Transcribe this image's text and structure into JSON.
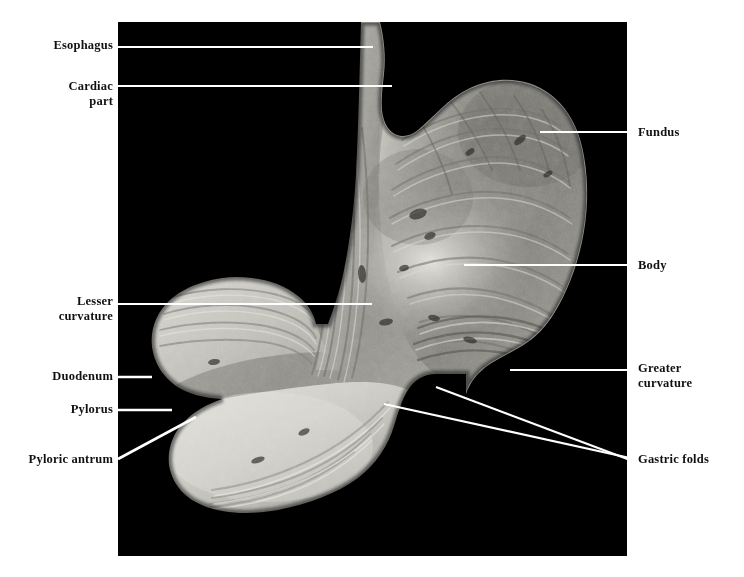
{
  "figure": {
    "type": "labeled-anatomical-photograph",
    "plate": {
      "background_color": "#000000",
      "left": 118,
      "top": 22,
      "width": 509,
      "height": 534
    },
    "page_background": "#ffffff",
    "leader_line_color": "#ffffff",
    "label_text_color": "#111111"
  },
  "labels": [
    {
      "id": "esophagus",
      "text": "Esophagus",
      "side": "left",
      "x": 113,
      "y": 38,
      "align": "right",
      "leader": {
        "kind": "horizontal",
        "x1": 118,
        "y1": 47,
        "x2": 373,
        "y2": 47
      }
    },
    {
      "id": "cardiac-part",
      "text": "Cardiac\npart",
      "side": "left",
      "x": 113,
      "y": 79,
      "align": "right",
      "leader": {
        "kind": "horizontal",
        "x1": 118,
        "y1": 86,
        "x2": 392,
        "y2": 86
      }
    },
    {
      "id": "lesser-curvature",
      "text": "Lesser\ncurvature",
      "side": "left",
      "x": 113,
      "y": 294,
      "align": "right",
      "leader": {
        "kind": "horizontal",
        "x1": 118,
        "y1": 304,
        "x2": 372,
        "y2": 304
      }
    },
    {
      "id": "duodenum",
      "text": "Duodenum",
      "side": "left",
      "x": 113,
      "y": 369,
      "align": "right",
      "leader": {
        "kind": "horizontal",
        "x1": 118,
        "y1": 377,
        "x2": 152,
        "y2": 377
      }
    },
    {
      "id": "pylorus",
      "text": "Pylorus",
      "side": "left",
      "x": 113,
      "y": 402,
      "align": "right",
      "leader": {
        "kind": "horizontal",
        "x1": 118,
        "y1": 410,
        "x2": 172,
        "y2": 410
      }
    },
    {
      "id": "pyloric-antrum",
      "text": "Pyloric antrum",
      "side": "left",
      "x": 113,
      "y": 452,
      "align": "right",
      "leader": {
        "kind": "diagonal",
        "x1": 118,
        "y1": 459,
        "x2": 196,
        "y2": 417
      }
    },
    {
      "id": "fundus",
      "text": "Fundus",
      "side": "right",
      "x": 638,
      "y": 125,
      "align": "left",
      "leader": {
        "kind": "horizontal",
        "x1": 540,
        "y1": 132,
        "x2": 632,
        "y2": 132
      }
    },
    {
      "id": "body",
      "text": "Body",
      "side": "right",
      "x": 638,
      "y": 258,
      "align": "left",
      "leader": {
        "kind": "horizontal",
        "x1": 464,
        "y1": 265,
        "x2": 632,
        "y2": 265
      }
    },
    {
      "id": "greater-curvature",
      "text": "Greater\ncurvature",
      "side": "right",
      "x": 638,
      "y": 361,
      "align": "left",
      "leader": {
        "kind": "horizontal",
        "x1": 510,
        "y1": 370,
        "x2": 632,
        "y2": 370
      }
    },
    {
      "id": "gastric-folds",
      "text": "Gastric folds",
      "side": "right",
      "x": 638,
      "y": 452,
      "align": "left",
      "leader": {
        "kind": "converging-pair",
        "a": {
          "x1": 384,
          "y1": 404,
          "x2": 630,
          "y2": 458
        },
        "b": {
          "x1": 436,
          "y1": 387,
          "x2": 630,
          "y2": 460
        }
      }
    }
  ],
  "specimen": {
    "description": "Grayscale photograph of an opened human stomach showing mucosal rugae, with esophagus entering superiorly at left and duodenum exiting inferiorly at left.",
    "regions": [
      "esophagus",
      "cardiac part",
      "fundus",
      "body",
      "lesser curvature",
      "greater curvature",
      "gastric folds",
      "pyloric antrum",
      "pylorus",
      "duodenum"
    ],
    "tone": {
      "darkest": "#000000",
      "mid": "#8d8d8a",
      "light": "#c9c8c2",
      "highlight": "#e3e2dc"
    }
  }
}
